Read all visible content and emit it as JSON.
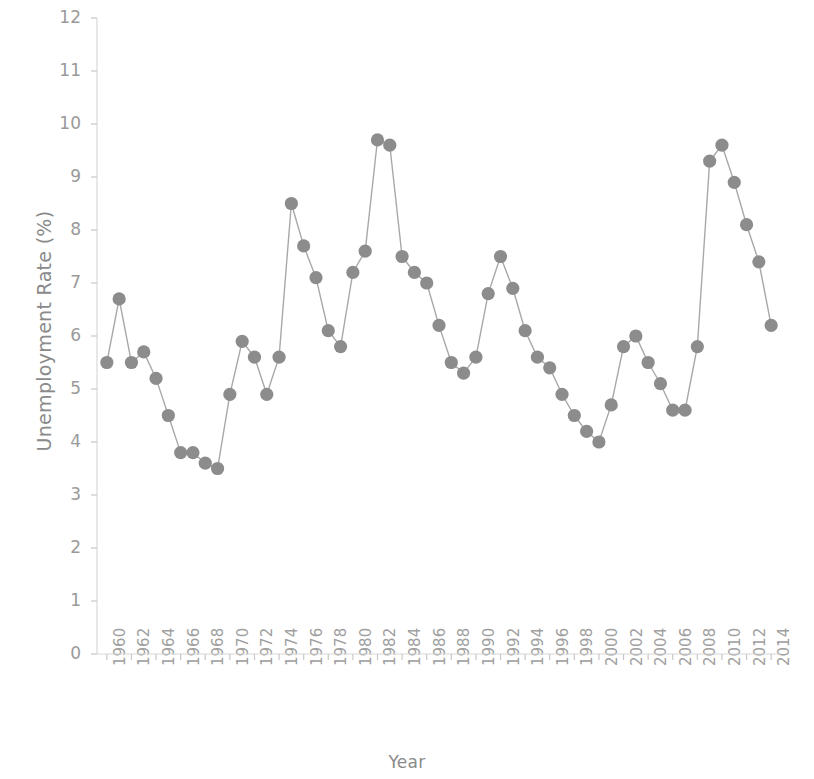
{
  "chart_data": {
    "type": "line",
    "title": "",
    "subtitle": "",
    "xlabel": "Year",
    "ylabel": "Unemployment Rate (%)",
    "xlim": [
      1959.2,
      2014.8
    ],
    "ylim": [
      0,
      12
    ],
    "grid": false,
    "legend": null,
    "marker": "circle",
    "marker_color": "#8c8c8c",
    "line_color": "#a8a8a8",
    "background_color": "#ffffff",
    "x_tick_labels": [
      "1960",
      "1962",
      "1964",
      "1966",
      "1968",
      "1970",
      "1972",
      "1974",
      "1976",
      "1978",
      "1980",
      "1982",
      "1984",
      "1986",
      "1988",
      "1990",
      "1992",
      "1994",
      "1996",
      "1998",
      "2000",
      "2002",
      "2004",
      "2006",
      "2008",
      "2010",
      "2012",
      "2014"
    ],
    "y_tick_labels": [
      "0",
      "1",
      "2",
      "3",
      "4",
      "5",
      "6",
      "7",
      "8",
      "9",
      "10",
      "11",
      "12"
    ],
    "y_ticks": [
      0,
      1,
      2,
      3,
      4,
      5,
      6,
      7,
      8,
      9,
      10,
      11,
      12
    ],
    "x": [
      1960,
      1961,
      1962,
      1963,
      1964,
      1965,
      1966,
      1967,
      1968,
      1969,
      1970,
      1971,
      1972,
      1973,
      1974,
      1975,
      1976,
      1977,
      1978,
      1979,
      1980,
      1981,
      1982,
      1983,
      1984,
      1985,
      1986,
      1987,
      1988,
      1989,
      1990,
      1991,
      1992,
      1993,
      1994,
      1995,
      1996,
      1997,
      1998,
      1999,
      2000,
      2001,
      2002,
      2003,
      2004,
      2005,
      2006,
      2007,
      2008,
      2009,
      2010,
      2011,
      2012,
      2013,
      2014
    ],
    "values": [
      5.5,
      6.7,
      5.5,
      5.7,
      5.2,
      4.5,
      3.8,
      3.8,
      3.6,
      3.5,
      4.9,
      5.9,
      5.6,
      4.9,
      5.6,
      8.5,
      7.7,
      7.1,
      6.1,
      5.8,
      7.2,
      7.6,
      9.7,
      9.6,
      7.5,
      7.2,
      7.0,
      6.2,
      5.5,
      5.3,
      5.6,
      6.8,
      7.5,
      6.9,
      6.1,
      5.6,
      5.4,
      4.9,
      4.5,
      4.2,
      4.0,
      4.7,
      5.8,
      6.0,
      5.5,
      5.1,
      4.6,
      4.6,
      5.8,
      9.3,
      9.6,
      8.9,
      8.1,
      7.4,
      6.2
    ],
    "series": [
      {
        "name": "Unemployment Rate",
        "values": [
          5.5,
          6.7,
          5.5,
          5.7,
          5.2,
          4.5,
          3.8,
          3.8,
          3.6,
          3.5,
          4.9,
          5.9,
          5.6,
          4.9,
          5.6,
          8.5,
          7.7,
          7.1,
          6.1,
          5.8,
          7.2,
          7.6,
          9.7,
          9.6,
          7.5,
          7.2,
          7.0,
          6.2,
          5.5,
          5.3,
          5.6,
          6.8,
          7.5,
          6.9,
          6.1,
          5.6,
          5.4,
          4.9,
          4.5,
          4.2,
          4.0,
          4.7,
          5.8,
          6.0,
          5.5,
          5.1,
          4.6,
          4.6,
          5.8,
          9.3,
          9.6,
          8.9,
          8.1,
          7.4,
          6.2
        ]
      }
    ]
  }
}
